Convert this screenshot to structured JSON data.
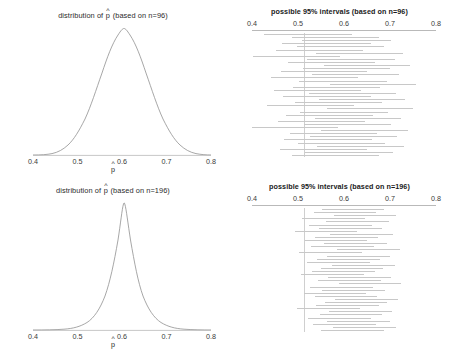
{
  "figure": {
    "axis_labels": {
      "phat": "p",
      "hat": "^"
    },
    "tick_labels": [
      "0.4",
      "0.5",
      "0.6",
      "0.7",
      "0.8"
    ],
    "tick_values": [
      0.4,
      0.5,
      0.6,
      0.7,
      0.8
    ],
    "line_color": "#8a8a8a",
    "axis_color": "#b9b9b9",
    "interval_color": "#c8c8c8",
    "reference_line_color": "#cfcfcf"
  },
  "panels": {
    "top_left": {
      "title_prefix": "distribution of ",
      "title_suffix": " (based on n=96)"
    },
    "top_right": {
      "title": "possible 95% intervals (based on n=96)"
    },
    "bottom_left": {
      "title_prefix": "distribution of ",
      "title_suffix": " (based on n=196)"
    },
    "bottom_right": {
      "title": "possible 95% intervals (based on n=196)"
    }
  },
  "chart_data": [
    {
      "type": "line",
      "panel": "top_left",
      "title": "distribution of p̂ (based on n=96)",
      "xlabel": "p̂",
      "ylabel": "",
      "xlim": [
        0.4,
        0.8
      ],
      "xticks": [
        0.4,
        0.5,
        0.6,
        0.7,
        0.8
      ],
      "grid": false,
      "legend": "none",
      "description": "normal sampling distribution of sample proportion",
      "distribution": {
        "mean": 0.6,
        "sd": 0.05,
        "n": 96
      }
    },
    {
      "type": "line",
      "panel": "bottom_left",
      "title": "distribution of p̂ (based on n=196)",
      "xlabel": "p̂",
      "ylabel": "",
      "xlim": [
        0.4,
        0.8
      ],
      "xticks": [
        0.4,
        0.5,
        0.6,
        0.7,
        0.8
      ],
      "grid": false,
      "legend": "none",
      "description": "normal sampling distribution of sample proportion",
      "distribution": {
        "mean": 0.6,
        "sd": 0.035,
        "n": 196
      }
    },
    {
      "type": "line",
      "panel": "top_right",
      "title": "possible 95% intervals (based on n=96)",
      "xlabel": "",
      "ylabel": "",
      "xlim": [
        0.4,
        0.8
      ],
      "xticks": [
        0.4,
        0.5,
        0.6,
        0.7,
        0.8
      ],
      "grid": false,
      "legend": "none",
      "description": "horizontal 95% confidence intervals, one per simulated sample, with vertical reference line",
      "reference_line": 0.513,
      "intervals": [
        [
          0.425,
          0.618
        ],
        [
          0.486,
          0.676
        ],
        [
          0.509,
          0.703
        ],
        [
          0.466,
          0.659
        ],
        [
          0.497,
          0.688
        ],
        [
          0.452,
          0.642
        ],
        [
          0.539,
          0.728
        ],
        [
          0.403,
          0.592
        ],
        [
          0.52,
          0.71
        ],
        [
          0.478,
          0.668
        ],
        [
          0.556,
          0.744
        ],
        [
          0.51,
          0.7
        ],
        [
          0.462,
          0.651
        ],
        [
          0.53,
          0.719
        ],
        [
          0.441,
          0.631
        ],
        [
          0.503,
          0.693
        ],
        [
          0.57,
          0.757
        ],
        [
          0.489,
          0.679
        ],
        [
          0.447,
          0.637
        ],
        [
          0.524,
          0.713
        ],
        [
          0.468,
          0.658
        ],
        [
          0.545,
          0.733
        ],
        [
          0.493,
          0.683
        ],
        [
          0.432,
          0.622
        ],
        [
          0.562,
          0.749
        ],
        [
          0.505,
          0.695
        ],
        [
          0.474,
          0.664
        ],
        [
          0.536,
          0.725
        ],
        [
          0.456,
          0.646
        ],
        [
          0.513,
          0.702
        ],
        [
          0.398,
          0.588
        ],
        [
          0.55,
          0.739
        ],
        [
          0.482,
          0.672
        ],
        [
          0.527,
          0.716
        ],
        [
          0.47,
          0.66
        ],
        [
          0.499,
          0.69
        ],
        [
          0.541,
          0.73
        ],
        [
          0.46,
          0.65
        ],
        [
          0.516,
          0.706
        ],
        [
          0.487,
          0.677
        ]
      ]
    },
    {
      "type": "line",
      "panel": "bottom_right",
      "title": "possible 95% intervals (based on n=196)",
      "xlabel": "",
      "ylabel": "",
      "xlim": [
        0.4,
        0.8
      ],
      "xticks": [
        0.4,
        0.5,
        0.6,
        0.7,
        0.8
      ],
      "grid": false,
      "legend": "none",
      "description": "horizontal 95% confidence intervals, one per simulated sample, with vertical reference line; narrower than n=96",
      "reference_line": 0.513,
      "intervals": [
        [
          0.552,
          0.688
        ],
        [
          0.534,
          0.67
        ],
        [
          0.578,
          0.714
        ],
        [
          0.509,
          0.645
        ],
        [
          0.561,
          0.697
        ],
        [
          0.524,
          0.66
        ],
        [
          0.546,
          0.682
        ],
        [
          0.493,
          0.629
        ],
        [
          0.57,
          0.706
        ],
        [
          0.538,
          0.674
        ],
        [
          0.515,
          0.651
        ],
        [
          0.557,
          0.693
        ],
        [
          0.529,
          0.665
        ],
        [
          0.585,
          0.721
        ],
        [
          0.503,
          0.639
        ],
        [
          0.564,
          0.7
        ],
        [
          0.542,
          0.678
        ],
        [
          0.52,
          0.656
        ],
        [
          0.574,
          0.71
        ],
        [
          0.549,
          0.685
        ],
        [
          0.531,
          0.667
        ],
        [
          0.507,
          0.643
        ],
        [
          0.566,
          0.702
        ],
        [
          0.544,
          0.68
        ],
        [
          0.589,
          0.725
        ],
        [
          0.526,
          0.662
        ],
        [
          0.553,
          0.689
        ],
        [
          0.512,
          0.648
        ],
        [
          0.536,
          0.672
        ],
        [
          0.581,
          0.717
        ],
        [
          0.558,
          0.694
        ],
        [
          0.54,
          0.676
        ],
        [
          0.498,
          0.634
        ],
        [
          0.568,
          0.704
        ],
        [
          0.547,
          0.683
        ],
        [
          0.522,
          0.658
        ],
        [
          0.563,
          0.699
        ],
        [
          0.533,
          0.669
        ],
        [
          0.576,
          0.712
        ],
        [
          0.551,
          0.687
        ]
      ]
    }
  ]
}
